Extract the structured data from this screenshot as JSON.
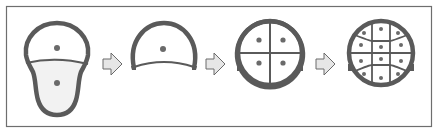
{
  "diagram": {
    "type": "process-sequence",
    "colors": {
      "outline": "#5a5a5a",
      "frame": "#6e6e6e",
      "dot": "#6a6a6a",
      "fill_light": "#f2f2f2",
      "arrow_fill": "#e6e6e6",
      "arrow_stroke": "#6a6a6a",
      "background": "#ffffff"
    },
    "stages": [
      {
        "id": 1,
        "shape": "pear-shaped body split into upper round part and lower lobe",
        "dots": 2,
        "segments": 2
      },
      {
        "id": 2,
        "shape": "half-dome with open curved base",
        "dots": 1,
        "segments": 1
      },
      {
        "id": 3,
        "shape": "circle divided into 4 quadrants",
        "dots": 4,
        "segments": 4
      },
      {
        "id": 4,
        "shape": "circle divided into 12 cells",
        "dots": 12,
        "segments": 12
      }
    ],
    "arrows": [
      {
        "from": 1,
        "to": 2,
        "icon": "right-arrow-icon"
      },
      {
        "from": 2,
        "to": 3,
        "icon": "right-arrow-icon"
      },
      {
        "from": 3,
        "to": 4,
        "icon": "right-arrow-icon"
      }
    ]
  }
}
